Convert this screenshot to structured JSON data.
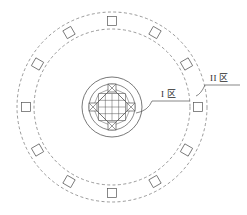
{
  "drawing": {
    "title": "Circular zone layout plan",
    "background_color": "#ffffff",
    "line_color": "#555555",
    "dashed_line_color": "#707070",
    "text_color": "#2b2b2b",
    "center": {
      "x": 112,
      "y": 107
    },
    "circles": [
      {
        "name": "outer-dashed-circle",
        "radius": 95,
        "style": "dashed",
        "zone": "II"
      },
      {
        "name": "middle-dashed-circle",
        "radius": 78,
        "style": "dashed",
        "zone": "II"
      },
      {
        "name": "core-outer-circle",
        "radius": 30,
        "style": "solid",
        "zone": "I"
      },
      {
        "name": "core-inner-circle",
        "radius": 23,
        "style": "solid",
        "zone": "I"
      }
    ],
    "ring_modules": {
      "count": 12,
      "ring_radius": 86,
      "module_size": 9,
      "module_shape": "square",
      "start_angle_deg": -90,
      "angles_deg": [
        -90,
        -60,
        -30,
        0,
        30,
        60,
        90,
        120,
        150,
        180,
        210,
        240
      ]
    },
    "core_assembly": {
      "name": "central-diamond-truss",
      "diamond_radius": 19,
      "node_count": 4,
      "node_size": 8,
      "node_shape": "crossed-square",
      "inner_grid_lines": 3,
      "node_angles_deg": [
        -90,
        0,
        90,
        180
      ]
    },
    "labels": [
      {
        "id": "zone-1",
        "text": "I 区",
        "x": 161,
        "y": 97,
        "leader": {
          "from_x": 136,
          "from_y": 113,
          "elbow_x": 152,
          "elbow_y": 101,
          "to_x": 190,
          "to_y": 101
        }
      },
      {
        "id": "zone-2",
        "text": "II 区",
        "x": 210,
        "y": 81,
        "leader": {
          "from_x": 196,
          "from_y": 96,
          "elbow_x": 205,
          "elbow_y": 85,
          "to_x": 240,
          "to_y": 85
        }
      }
    ]
  }
}
